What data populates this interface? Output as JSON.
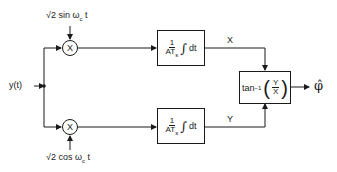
{
  "diagram": {
    "type": "block-diagram",
    "input": {
      "label": "y(t)"
    },
    "references": {
      "top": "√2 sin ω",
      "top_sub": "c",
      "top_tail": " t",
      "bottom": "√2 cos ω",
      "bottom_sub": "c",
      "bottom_tail": " t"
    },
    "multipliers": {
      "symbol": "X"
    },
    "integrators": {
      "numerator": "1",
      "denominator": "AT",
      "denominator_sub": "s",
      "integral": "∫",
      "dt": "dt"
    },
    "signals": {
      "top": "X",
      "bottom": "Y"
    },
    "arctan_block": {
      "fn": "tan",
      "sup": "−1",
      "num": "Y",
      "den": "X"
    },
    "output": {
      "label": "φ̂"
    },
    "colors": {
      "line": "#1a1a1a",
      "background": "#ffffff"
    }
  }
}
